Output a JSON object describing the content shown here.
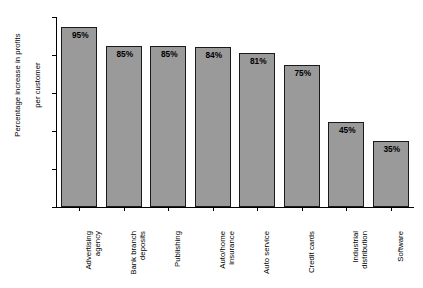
{
  "chart_data": {
    "type": "bar",
    "title": "",
    "subtitle": "",
    "xlabel": "",
    "ylabel": "Percentage increase in profits per customer",
    "ylabel_lines": [
      "Percentage increase in profits",
      "per customer"
    ],
    "ylim": [
      0,
      100
    ],
    "yticks": [
      0,
      20,
      40,
      60,
      80,
      100
    ],
    "ytick_labels": [
      "0",
      "20",
      "40",
      "60",
      "80",
      "100%"
    ],
    "grid": false,
    "legend": false,
    "bar_color": "#9a9a9a",
    "bar_edge_color": "#1a1a1a",
    "categories": [
      "Advertising agency",
      "Bank branch deposits",
      "Publishing",
      "Auto/home insurance",
      "Auto service",
      "Credit cards",
      "Industrial distribution",
      "Software"
    ],
    "category_lines": [
      [
        "Advertising",
        "agency"
      ],
      [
        "Bank branch",
        "deposits"
      ],
      [
        "Publishing"
      ],
      [
        "Auto/home",
        "insurance"
      ],
      [
        "Auto service"
      ],
      [
        "Credit cards"
      ],
      [
        "Industrial",
        "distribution"
      ],
      [
        "Software"
      ]
    ],
    "values": [
      95,
      85,
      85,
      84,
      81,
      75,
      45,
      35
    ],
    "value_labels": [
      "95%",
      "85%",
      "85%",
      "84%",
      "81%",
      "75%",
      "45%",
      "35%"
    ]
  }
}
